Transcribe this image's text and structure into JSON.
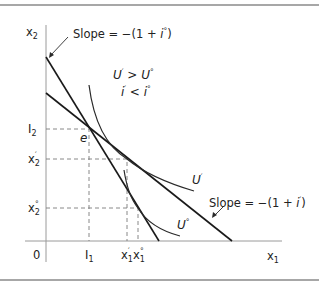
{
  "figure": {
    "type": "economics-diagram"
  },
  "axes": {
    "x_label": "x",
    "x_label_sub": "1",
    "y_label": "x",
    "y_label_sub": "2",
    "origin_label": "0"
  },
  "ticks": {
    "x": [
      {
        "base": "I",
        "sub": "1",
        "sup": ""
      },
      {
        "base": "x",
        "sub": "1",
        "sup": "′"
      },
      {
        "base": "x",
        "sub": "1",
        "sup": "°"
      }
    ],
    "y": [
      {
        "base": "I",
        "sub": "2",
        "sup": ""
      },
      {
        "base": "x",
        "sub": "2",
        "sup": "′"
      },
      {
        "base": "x",
        "sub": "2",
        "sup": "°"
      }
    ]
  },
  "annotations": {
    "slope_original": {
      "prefix": "Slope = −(1 + ",
      "var": "i",
      "sup": "°",
      "suffix": ")"
    },
    "slope_new": {
      "prefix": "Slope = −(1 + ",
      "var": "i",
      "sup": "′",
      "suffix": ")"
    },
    "endowment_point": "e",
    "utility_compare": {
      "left": "U",
      "left_sup": "′",
      "op": " > ",
      "right": "U",
      "right_sup": "°"
    },
    "rate_compare": {
      "left": "i",
      "left_sup": "′",
      "op": " < ",
      "right": "i",
      "right_sup": "°"
    },
    "curve_U_new": {
      "base": "U",
      "sup": "′"
    },
    "curve_U_orig": {
      "base": "U",
      "sup": "°"
    }
  },
  "colors": {
    "lines": "#1a1a1a",
    "axes": "#9a9a9a",
    "guides": "#7a7a7a",
    "rules": "#8a8a8a"
  }
}
